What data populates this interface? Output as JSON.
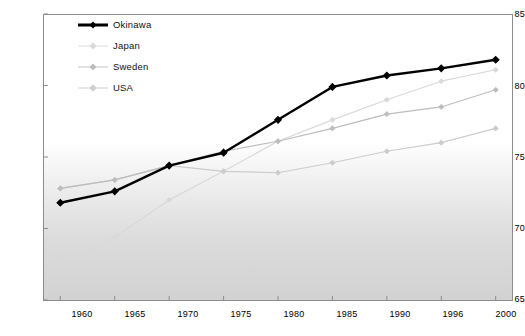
{
  "chart_data": {
    "type": "line",
    "title": "",
    "subtitle": "",
    "xlabel": "",
    "ylabel": "",
    "xlim": [
      1960,
      2000
    ],
    "ylim": [
      65,
      85
    ],
    "grid": false,
    "legend_position": "top-left",
    "categories": [
      "1960",
      "1965",
      "1970",
      "1975",
      "1980",
      "1985",
      "1990",
      "1996",
      "2000"
    ],
    "x_tick_labels": [
      "1960",
      "1965",
      "1970",
      "1975",
      "1980",
      "1985",
      "1990",
      "1996",
      "2000"
    ],
    "y_tick_labels": [
      "65",
      "70",
      "75",
      "80",
      "85"
    ],
    "y_ticks": [
      65,
      70,
      75,
      80,
      85
    ],
    "series": [
      {
        "name": "Okinawa",
        "color": "#000000",
        "values": [
          71.8,
          72.6,
          74.4,
          75.3,
          77.6,
          79.9,
          80.7,
          81.2,
          81.8
        ]
      },
      {
        "name": "Japan",
        "color": "#d9d9d9",
        "values": [
          67.6,
          69.4,
          72.0,
          74.0,
          76.1,
          77.6,
          79.0,
          80.3,
          81.1
        ]
      },
      {
        "name": "Sweden",
        "color": "#bdbdbd",
        "values": [
          72.8,
          73.4,
          74.4,
          75.4,
          76.1,
          77.0,
          78.0,
          78.5,
          79.7
        ]
      },
      {
        "name": "USA",
        "color": "#cccccc",
        "values": [
          72.8,
          73.4,
          74.4,
          74.0,
          73.9,
          74.6,
          75.4,
          76.0,
          77.0
        ]
      }
    ]
  },
  "legend": {
    "items": [
      {
        "label": "Okinawa",
        "marker": "diamond-marker",
        "color": "#000000"
      },
      {
        "label": "Japan",
        "marker": "diamond-marker",
        "color": "#d9d9d9"
      },
      {
        "label": "Sweden",
        "marker": "diamond-marker",
        "color": "#bdbdbd"
      },
      {
        "label": "USA",
        "marker": "diamond-marker",
        "color": "#cccccc"
      }
    ]
  },
  "axes": {
    "y": {
      "labels": [
        "85",
        "80",
        "75",
        "70",
        "65"
      ]
    },
    "x": {
      "labels": [
        "1960",
        "1965",
        "1970",
        "1975",
        "1980",
        "1985",
        "1990",
        "1996",
        "2000"
      ]
    }
  }
}
